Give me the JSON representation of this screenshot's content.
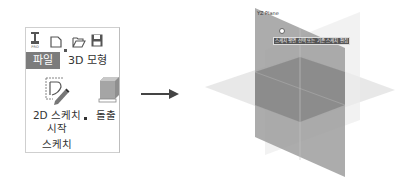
{
  "ribbon": {
    "app_logo": "PRO",
    "quick_access": [
      "new-file",
      "open-folder",
      "save"
    ],
    "tabs": [
      {
        "label": "파일",
        "active": true
      },
      {
        "label": "3D 모형",
        "active": false
      }
    ],
    "buttons": {
      "start_sketch_line1": "2D 스케치",
      "start_sketch_line2": "시작",
      "extrude": "돌출"
    },
    "group_label": "스케치"
  },
  "arrow": {
    "direction": "right"
  },
  "viewport": {
    "plane_label": "YZ Plane",
    "tooltip": "스케치 평면 선택 또는 기존 스케치 편집",
    "colors": {
      "vertical_plane": "#9a9a9a",
      "horizontal_plane": "#d8d8d8",
      "overlap": "#808080"
    }
  }
}
